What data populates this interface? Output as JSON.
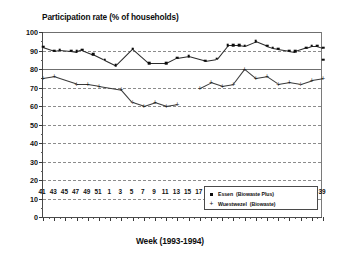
{
  "chart_data": {
    "type": "scatter",
    "title": "Participation rate (% of households)",
    "xlabel": "Week (1993-1994)",
    "ylabel": "",
    "ylim": [
      0,
      100
    ],
    "ytick_step": 10,
    "yticks": [
      0,
      10,
      20,
      30,
      40,
      50,
      60,
      70,
      80,
      90,
      100
    ],
    "grid": true,
    "legend_position": "bottom-right",
    "x_tick_labels": [
      "41",
      "43",
      "45",
      "47",
      "49",
      "51",
      "1",
      "3",
      "5",
      "7",
      "9",
      "11",
      "13",
      "15",
      "17",
      "19",
      "21",
      "23",
      "25",
      "27",
      "29",
      "31",
      "33",
      "35",
      "37",
      "39"
    ],
    "x_index_range": [
      41,
      79
    ],
    "series": [
      {
        "name": "Essen",
        "sublabel": "(Biowaste Plus)",
        "marker": "square",
        "color": "#0b0b0b",
        "x": [
          41,
          42,
          43,
          44,
          45,
          46,
          47,
          48,
          49,
          50,
          51,
          52,
          1,
          2,
          3,
          4,
          5,
          6,
          7,
          8,
          9,
          10,
          11,
          12,
          13,
          14,
          15,
          16,
          17,
          18,
          19,
          20,
          21,
          22,
          23,
          24,
          25,
          26,
          27,
          28,
          29,
          30,
          31,
          32,
          33,
          34,
          35,
          36,
          37,
          38,
          39
        ],
        "values": [
          92,
          null,
          90,
          90.5,
          null,
          90,
          89.5,
          90.5,
          null,
          88,
          null,
          85,
          null,
          82,
          null,
          null,
          91,
          null,
          null,
          83,
          null,
          null,
          83,
          null,
          86,
          null,
          87,
          null,
          null,
          84.5,
          null,
          85.5,
          null,
          93,
          93,
          93,
          92.5,
          null,
          95,
          null,
          92.5,
          91.5,
          91,
          null,
          90,
          89.5,
          null,
          91.5,
          92.5,
          92.5,
          91.5
        ],
        "late_points": {
          "x": [
            39
          ],
          "values": [
            85
          ]
        }
      },
      {
        "name": "Wuestwezel",
        "sublabel": "(Biowaste)",
        "marker": "plus",
        "color": "#161616",
        "x": [
          41,
          43,
          45,
          47,
          49,
          51,
          1,
          3,
          5,
          7,
          9,
          11,
          13,
          15,
          17,
          19,
          21,
          23,
          25,
          27,
          29,
          31,
          33,
          35,
          37,
          39
        ],
        "values": [
          75,
          76,
          null,
          72,
          72,
          71,
          null,
          69,
          62,
          60,
          62,
          60,
          61,
          null,
          70,
          73,
          71,
          72,
          80,
          75,
          76,
          72,
          73,
          72,
          74,
          75
        ]
      }
    ]
  },
  "legend": {
    "entries": [
      {
        "symbol": "square",
        "name": "Essen",
        "sublabel": "(Biowaste Plus)"
      },
      {
        "symbol": "plus",
        "name": "Wuestwezel",
        "sublabel": "(Biowaste)"
      }
    ]
  },
  "colors": {
    "series1": "#0b0b0b",
    "series2": "#161616",
    "grid": "#8c8c8c",
    "axis": "#4a4a4a",
    "background": "#ffffff"
  }
}
